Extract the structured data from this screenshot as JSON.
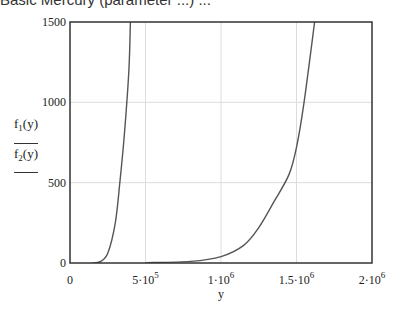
{
  "header": {
    "cut_text": "Basic Mercury (parameter ...) ..."
  },
  "chart_data": {
    "type": "line",
    "title": "",
    "xlabel": "y",
    "ylabel_series": [
      "f1(y)",
      "f2(y)"
    ],
    "xlim": [
      0,
      2000000
    ],
    "ylim": [
      0,
      1500
    ],
    "grid": true,
    "x_ticks": [
      {
        "value": 0,
        "label": "0",
        "base": "",
        "exp": ""
      },
      {
        "value": 500000,
        "label": "5·10^5",
        "base": "5·10",
        "exp": "5"
      },
      {
        "value": 1000000,
        "label": "1·10^6",
        "base": "1·10",
        "exp": "6"
      },
      {
        "value": 1500000,
        "label": "1.5·10^6",
        "base": "1.5·10",
        "exp": "6"
      },
      {
        "value": 2000000,
        "label": "2·10^6",
        "base": "2·10",
        "exp": "6"
      }
    ],
    "y_ticks": [
      {
        "value": 0,
        "label": "0"
      },
      {
        "value": 500,
        "label": "500"
      },
      {
        "value": 1000,
        "label": "1000"
      },
      {
        "value": 1500,
        "label": "1500"
      }
    ],
    "series": [
      {
        "name": "f1(y)",
        "points": [
          [
            150000,
            0
          ],
          [
            200000,
            8
          ],
          [
            250000,
            60
          ],
          [
            300000,
            250
          ],
          [
            330000,
            500
          ],
          [
            360000,
            800
          ],
          [
            390000,
            1200
          ],
          [
            400000,
            1500
          ]
        ]
      },
      {
        "name": "f2(y)",
        "points": [
          [
            500000,
            2
          ],
          [
            800000,
            10
          ],
          [
            1000000,
            40
          ],
          [
            1150000,
            110
          ],
          [
            1250000,
            220
          ],
          [
            1350000,
            380
          ],
          [
            1450000,
            550
          ],
          [
            1500000,
            720
          ],
          [
            1550000,
            1000
          ],
          [
            1620000,
            1500
          ]
        ]
      }
    ]
  },
  "labels": {
    "f1": "f",
    "f1_sub": "1",
    "f1_arg": "(y)",
    "f2": "f",
    "f2_sub": "2",
    "f2_arg": "(y)",
    "x": "y"
  }
}
